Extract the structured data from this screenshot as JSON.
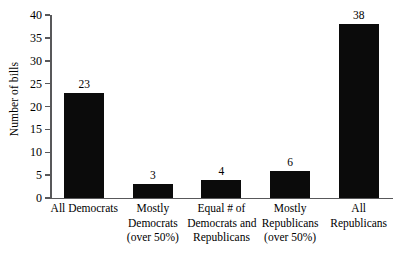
{
  "chart_data": {
    "type": "bar",
    "title": "",
    "subtitle": "",
    "xlabel": "",
    "ylabel": "Number of bills",
    "ylim": [
      0,
      40
    ],
    "ytick_step": 5,
    "yticks": [
      0,
      5,
      10,
      15,
      20,
      25,
      30,
      35,
      40
    ],
    "ytick_labels": [
      "0",
      "5",
      "10",
      "15",
      "20",
      "25",
      "30",
      "35",
      "40"
    ],
    "grid": false,
    "legend": false,
    "legend_position": "none",
    "bar_color": "#0b0b0b",
    "axis_color": "#58585a",
    "data_labels": true,
    "categories": [
      "All Democrats",
      "Mostly Democrats (over 50%)",
      "Equal # of Democrats and Republicans",
      "Mostly Republicans (over 50%)",
      "All Republicans"
    ],
    "category_lines": [
      [
        "All Democrats"
      ],
      [
        "Mostly",
        "Democrats",
        "(over 50%)"
      ],
      [
        "Equal # of",
        "Democrats and",
        "Republicans"
      ],
      [
        "Mostly",
        "Republicans",
        "(over 50%)"
      ],
      [
        "All",
        "Republicans"
      ]
    ],
    "values": [
      23,
      3,
      4,
      6,
      38
    ],
    "value_labels": [
      "23",
      "3",
      "4",
      "6",
      "38"
    ]
  }
}
